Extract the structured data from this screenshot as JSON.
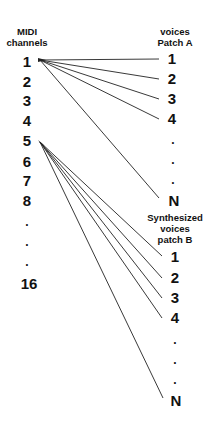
{
  "left_column": {
    "header_line1": "MIDI",
    "header_line2": "channels",
    "items": [
      "1",
      "2",
      "3",
      "4",
      "5",
      "6",
      "7",
      "8",
      ".",
      ".",
      ".",
      "16"
    ]
  },
  "patch_a": {
    "header_line1": "voices",
    "header_line2": "Patch A",
    "items": [
      "1",
      "2",
      "3",
      "4",
      ".",
      ".",
      ".",
      "N"
    ]
  },
  "patch_b": {
    "header_line1": "Synthesized",
    "header_line2": "voices",
    "header_line3": "patch B",
    "items": [
      "1",
      "2",
      "3",
      "4",
      ".",
      ".",
      ".",
      "N"
    ]
  },
  "connections": {
    "channel_1_to_patch_a": [
      "1",
      "2",
      "3",
      "4",
      "N"
    ],
    "channel_5_to_patch_b": [
      "1",
      "2",
      "3",
      "4",
      "N"
    ]
  },
  "colors": {
    "line": "#222222",
    "text": "#111111",
    "background": "#ffffff"
  }
}
